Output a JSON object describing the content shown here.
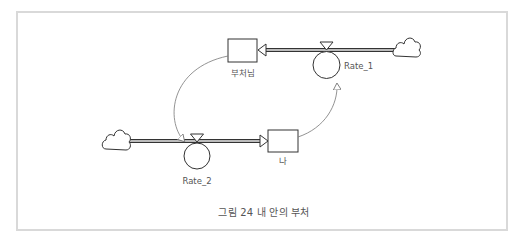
{
  "diagram": {
    "type": "stock-and-flow",
    "stocks": [
      {
        "id": "stock_buddha",
        "label": "부처님"
      },
      {
        "id": "stock_me",
        "label": "나"
      }
    ],
    "flows": [
      {
        "id": "rate_1",
        "label": "Rate_1",
        "from": "cloud_right",
        "to": "stock_buddha"
      },
      {
        "id": "rate_2",
        "label": "Rate_2",
        "from": "cloud_left",
        "to": "stock_me"
      }
    ],
    "connectors": [
      {
        "from": "stock_buddha",
        "to": "rate_2"
      },
      {
        "from": "stock_me",
        "to": "rate_1"
      }
    ],
    "caption": "그림 24 내 안의 부처",
    "colors": {
      "line": "#333333",
      "text": "#555555",
      "frame": "#d9d9d9",
      "connector": "#666666"
    }
  }
}
